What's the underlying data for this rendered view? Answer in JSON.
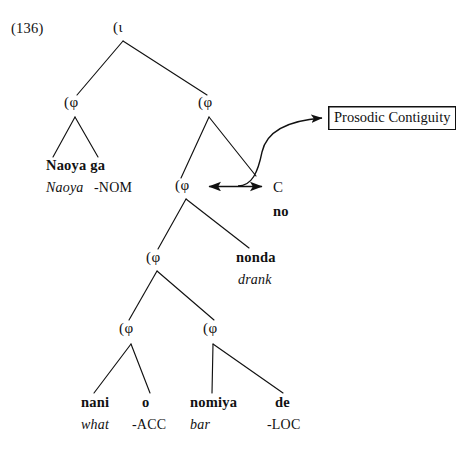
{
  "figure": {
    "example_number": "(136)",
    "annotation_box_label": "Prosodic Contiguity",
    "ink_color": "#111111",
    "background_color": "#ffffff"
  },
  "nodes": {
    "root_iota": "(ι",
    "phi_left": "(φ",
    "phi_right": "(φ",
    "phi_mid_upper": "(φ",
    "phi_mid_lower": "(φ",
    "phi_bottom_left": "(φ",
    "phi_bottom_right": "(φ"
  },
  "terminals": {
    "subject": {
      "surface": "Naoya ga",
      "gloss_italic": "Naoya",
      "gloss_upright": "-NOM"
    },
    "verb": {
      "surface": "nonda",
      "gloss_italic": "drank"
    },
    "complementizer": {
      "category": "C",
      "surface": "no"
    },
    "wh_object": {
      "surface": "nani",
      "gloss_italic": "what"
    },
    "accusative": {
      "surface": "o",
      "gloss_upright": "-ACC"
    },
    "location_noun": {
      "surface": "nomiya",
      "gloss_italic": "bar"
    },
    "locative": {
      "surface": "de",
      "gloss_upright": "-LOC"
    }
  },
  "arrows": {
    "double_headed_label": "",
    "curved_pointer_label": ""
  }
}
